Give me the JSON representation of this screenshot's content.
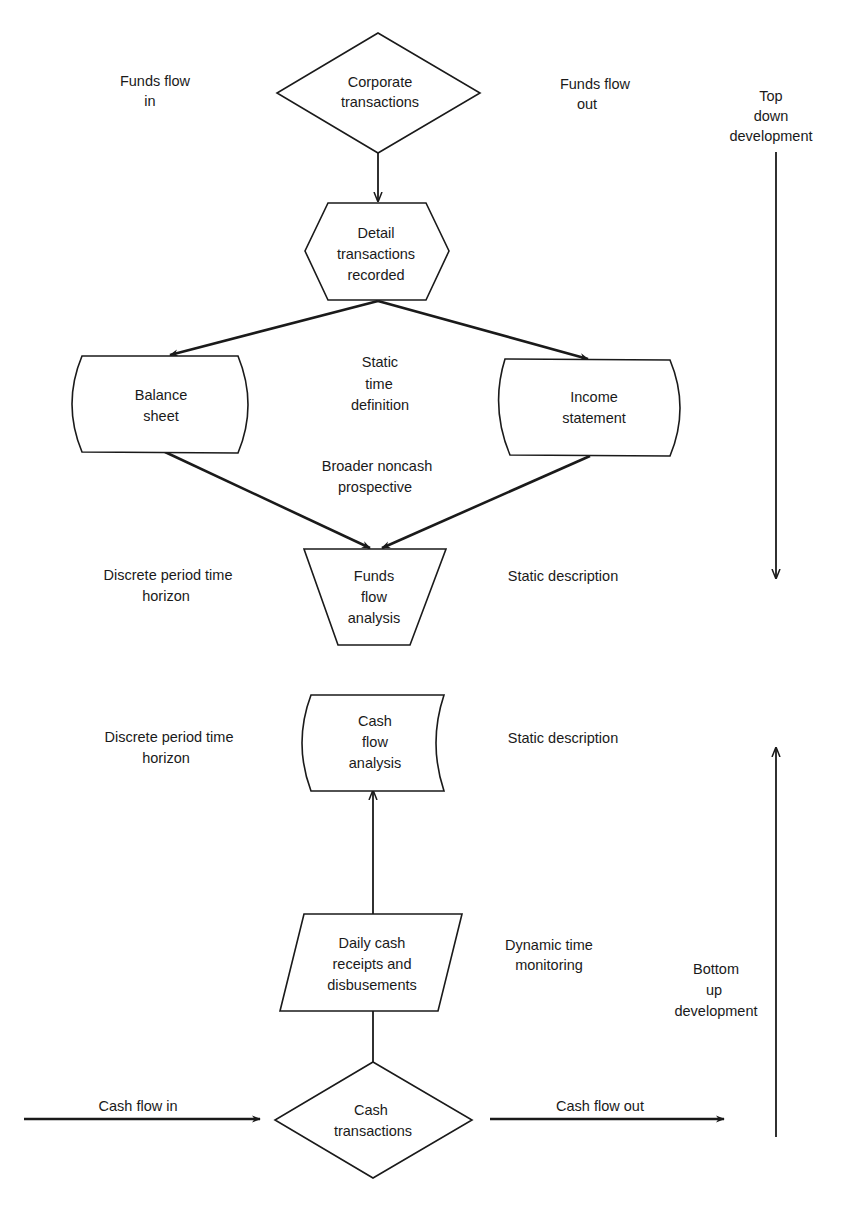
{
  "diagram": {
    "nodes": {
      "corporate_transactions": {
        "shape": "diamond",
        "lines": [
          "Corporate",
          "transactions"
        ]
      },
      "detail_recorded": {
        "shape": "hexagon",
        "lines": [
          "Detail",
          "transactions",
          "recorded"
        ]
      },
      "balance_sheet": {
        "shape": "curved-rectangle",
        "lines": [
          "Balance",
          "sheet"
        ]
      },
      "income_statement": {
        "shape": "curved-rectangle",
        "lines": [
          "Income",
          "statement"
        ]
      },
      "funds_flow_analysis": {
        "shape": "inverted-trapezoid",
        "lines": [
          "Funds",
          "flow",
          "analysis"
        ]
      },
      "cash_flow_analysis": {
        "shape": "stored-data",
        "lines": [
          "Cash",
          "flow",
          "analysis"
        ]
      },
      "daily_cash": {
        "shape": "parallelogram",
        "lines": [
          "Daily cash",
          "receipts and",
          "disbusements"
        ]
      },
      "cash_transactions": {
        "shape": "diamond",
        "lines": [
          "Cash",
          "transactions"
        ]
      }
    },
    "annotations": {
      "funds_flow_in": [
        "Funds flow",
        "in"
      ],
      "funds_flow_out": [
        "Funds flow",
        "out"
      ],
      "top_down": [
        "Top",
        "down",
        "development"
      ],
      "static_time_definition": [
        "Static",
        "time",
        "definition"
      ],
      "broader_noncash": [
        "Broader noncash",
        "prospective"
      ],
      "discrete_period_1": [
        "Discrete period time",
        "horizon"
      ],
      "static_description_1": [
        "Static description"
      ],
      "discrete_period_2": [
        "Discrete period time",
        "horizon"
      ],
      "static_description_2": [
        "Static description"
      ],
      "dynamic_time": [
        "Dynamic time",
        "monitoring"
      ],
      "bottom_up": [
        "Bottom",
        "up",
        "development"
      ],
      "cash_flow_in": [
        "Cash flow in"
      ],
      "cash_flow_out": [
        "Cash flow out"
      ]
    },
    "edges": [
      {
        "from": "corporate_transactions",
        "to": "detail_recorded"
      },
      {
        "from": "detail_recorded",
        "to": "balance_sheet"
      },
      {
        "from": "detail_recorded",
        "to": "income_statement"
      },
      {
        "from": "balance_sheet",
        "to": "funds_flow_analysis"
      },
      {
        "from": "income_statement",
        "to": "funds_flow_analysis"
      },
      {
        "from": "daily_cash",
        "to": "cash_flow_analysis"
      },
      {
        "from": "cash_transactions",
        "to": "daily_cash"
      },
      {
        "from": "external",
        "to": "cash_transactions",
        "label": "Cash flow in"
      },
      {
        "from": "cash_transactions",
        "to": "external",
        "label": "Cash flow out"
      }
    ],
    "colors": {
      "ink": "#1a1a1a",
      "background": "#ffffff"
    }
  }
}
